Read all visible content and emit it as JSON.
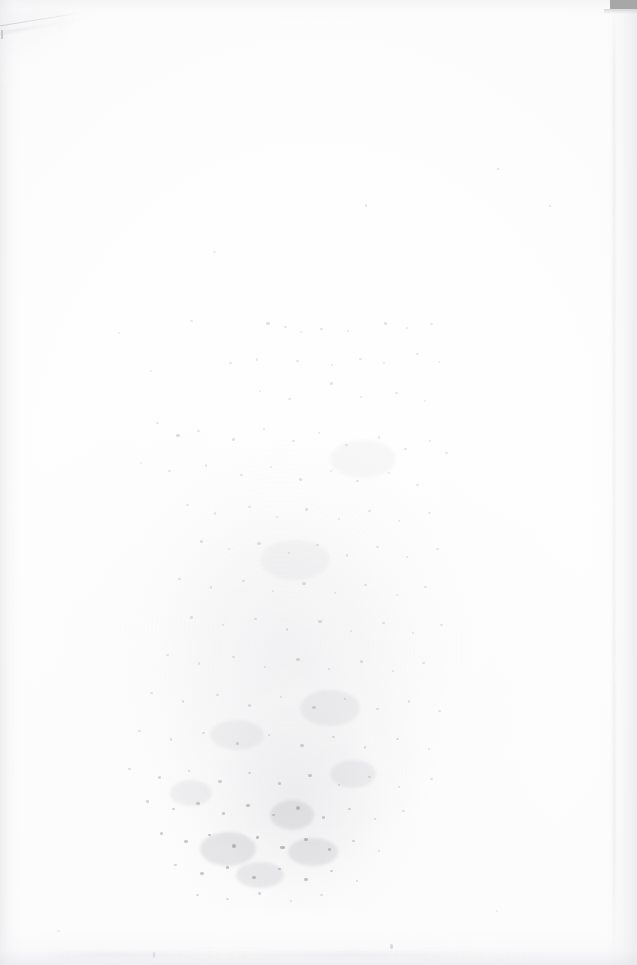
{
  "document": {
    "kind": "scanned-page",
    "description": "Blank verso of a scanned paper page",
    "page_width_px": 637,
    "page_height_px": 965,
    "visible_text": "",
    "text_legible": false,
    "orientation": "portrait"
  },
  "colors": {
    "paper_white": "#fdfdfd",
    "paper_tint": "#fbfbfc",
    "scanner_artifact_gray": "#a7a7a8",
    "edge_shadow_gray": "#e4e4e7",
    "crease_gray": "#c4c4c9",
    "speckle_ink_gray": "#8e8e96"
  },
  "artifacts": {
    "scanner_bed_patch": {
      "name": "scanner-bed-edge-artifact",
      "position": "top-right",
      "x": 610,
      "y": 0,
      "width": 27,
      "height": 9,
      "color": "#a7a7a8"
    },
    "corner_crease": {
      "name": "paper-fold-crease",
      "position": "top-left",
      "x": 0,
      "y": 6,
      "width": 96,
      "height": 34,
      "angle_deg": -9.4
    },
    "edge_shadows": [
      {
        "name": "left-edge-shadow",
        "side": "left",
        "width": 26
      },
      {
        "name": "right-edge-shadow",
        "side": "right",
        "width": 46
      },
      {
        "name": "top-edge-shadow",
        "side": "top",
        "height": 22
      },
      {
        "name": "bottom-edge-shadow",
        "side": "bottom",
        "height": 34
      }
    ],
    "bleed_through": {
      "name": "reverse-side-ink-bleed",
      "position": "lower-center",
      "bounds": {
        "x": 96,
        "y": 286,
        "width": 384,
        "height": 626
      },
      "densest_region": {
        "x": 170,
        "y": 775,
        "width": 200,
        "height": 110
      },
      "legible": false
    }
  },
  "speckles": [
    {
      "x": 497,
      "y": 168,
      "w": 2,
      "h": 2,
      "o": 0.3
    },
    {
      "x": 549,
      "y": 205,
      "w": 2,
      "h": 2,
      "o": 0.26
    },
    {
      "x": 365,
      "y": 204,
      "w": 2,
      "h": 3,
      "o": 0.22
    },
    {
      "x": 213,
      "y": 251,
      "w": 3,
      "h": 2,
      "o": 0.18
    },
    {
      "x": 190,
      "y": 320,
      "w": 3,
      "h": 2,
      "o": 0.2
    },
    {
      "x": 266,
      "y": 322,
      "w": 4,
      "h": 3,
      "o": 0.26
    },
    {
      "x": 284,
      "y": 326,
      "w": 3,
      "h": 2,
      "o": 0.22
    },
    {
      "x": 300,
      "y": 331,
      "w": 2,
      "h": 2,
      "o": 0.2
    },
    {
      "x": 320,
      "y": 328,
      "w": 3,
      "h": 2,
      "o": 0.24
    },
    {
      "x": 347,
      "y": 330,
      "w": 2,
      "h": 2,
      "o": 0.2
    },
    {
      "x": 384,
      "y": 322,
      "w": 3,
      "h": 3,
      "o": 0.26
    },
    {
      "x": 406,
      "y": 327,
      "w": 2,
      "h": 2,
      "o": 0.2
    },
    {
      "x": 430,
      "y": 323,
      "w": 3,
      "h": 2,
      "o": 0.22
    },
    {
      "x": 118,
      "y": 332,
      "w": 2,
      "h": 2,
      "o": 0.16
    },
    {
      "x": 229,
      "y": 362,
      "w": 3,
      "h": 2,
      "o": 0.22
    },
    {
      "x": 256,
      "y": 358,
      "w": 2,
      "h": 3,
      "o": 0.2
    },
    {
      "x": 296,
      "y": 360,
      "w": 3,
      "h": 2,
      "o": 0.24
    },
    {
      "x": 331,
      "y": 364,
      "w": 2,
      "h": 2,
      "o": 0.2
    },
    {
      "x": 359,
      "y": 358,
      "w": 3,
      "h": 2,
      "o": 0.22
    },
    {
      "x": 383,
      "y": 362,
      "w": 2,
      "h": 2,
      "o": 0.18
    },
    {
      "x": 416,
      "y": 353,
      "w": 3,
      "h": 2,
      "o": 0.22
    },
    {
      "x": 438,
      "y": 361,
      "w": 2,
      "h": 2,
      "o": 0.18
    },
    {
      "x": 150,
      "y": 370,
      "w": 2,
      "h": 2,
      "o": 0.16
    },
    {
      "x": 330,
      "y": 382,
      "w": 3,
      "h": 3,
      "o": 0.24
    },
    {
      "x": 259,
      "y": 390,
      "w": 2,
      "h": 2,
      "o": 0.18
    },
    {
      "x": 288,
      "y": 398,
      "w": 3,
      "h": 2,
      "o": 0.22
    },
    {
      "x": 360,
      "y": 396,
      "w": 2,
      "h": 2,
      "o": 0.2
    },
    {
      "x": 395,
      "y": 392,
      "w": 3,
      "h": 2,
      "o": 0.22
    },
    {
      "x": 424,
      "y": 400,
      "w": 2,
      "h": 2,
      "o": 0.18
    },
    {
      "x": 156,
      "y": 422,
      "w": 3,
      "h": 2,
      "o": 0.2
    },
    {
      "x": 176,
      "y": 434,
      "w": 4,
      "h": 3,
      "o": 0.3
    },
    {
      "x": 197,
      "y": 430,
      "w": 3,
      "h": 2,
      "o": 0.24
    },
    {
      "x": 232,
      "y": 438,
      "w": 3,
      "h": 3,
      "o": 0.26
    },
    {
      "x": 263,
      "y": 428,
      "w": 2,
      "h": 2,
      "o": 0.2
    },
    {
      "x": 292,
      "y": 440,
      "w": 3,
      "h": 2,
      "o": 0.24
    },
    {
      "x": 318,
      "y": 432,
      "w": 2,
      "h": 2,
      "o": 0.2
    },
    {
      "x": 345,
      "y": 444,
      "w": 3,
      "h": 2,
      "o": 0.24
    },
    {
      "x": 378,
      "y": 436,
      "w": 2,
      "h": 3,
      "o": 0.22
    },
    {
      "x": 404,
      "y": 448,
      "w": 3,
      "h": 2,
      "o": 0.24
    },
    {
      "x": 429,
      "y": 440,
      "w": 2,
      "h": 2,
      "o": 0.2
    },
    {
      "x": 445,
      "y": 452,
      "w": 3,
      "h": 2,
      "o": 0.22
    },
    {
      "x": 140,
      "y": 462,
      "w": 2,
      "h": 2,
      "o": 0.18
    },
    {
      "x": 168,
      "y": 470,
      "w": 3,
      "h": 2,
      "o": 0.22
    },
    {
      "x": 205,
      "y": 464,
      "w": 2,
      "h": 3,
      "o": 0.2
    },
    {
      "x": 240,
      "y": 474,
      "w": 3,
      "h": 2,
      "o": 0.24
    },
    {
      "x": 270,
      "y": 466,
      "w": 2,
      "h": 2,
      "o": 0.2
    },
    {
      "x": 299,
      "y": 478,
      "w": 3,
      "h": 3,
      "o": 0.26
    },
    {
      "x": 330,
      "y": 470,
      "w": 2,
      "h": 2,
      "o": 0.2
    },
    {
      "x": 356,
      "y": 480,
      "w": 3,
      "h": 2,
      "o": 0.24
    },
    {
      "x": 388,
      "y": 472,
      "w": 2,
      "h": 2,
      "o": 0.2
    },
    {
      "x": 416,
      "y": 484,
      "w": 3,
      "h": 2,
      "o": 0.22
    },
    {
      "x": 186,
      "y": 504,
      "w": 3,
      "h": 2,
      "o": 0.22
    },
    {
      "x": 214,
      "y": 512,
      "w": 2,
      "h": 3,
      "o": 0.22
    },
    {
      "x": 248,
      "y": 506,
      "w": 3,
      "h": 2,
      "o": 0.24
    },
    {
      "x": 276,
      "y": 516,
      "w": 2,
      "h": 2,
      "o": 0.2
    },
    {
      "x": 305,
      "y": 508,
      "w": 3,
      "h": 3,
      "o": 0.26
    },
    {
      "x": 338,
      "y": 518,
      "w": 2,
      "h": 2,
      "o": 0.22
    },
    {
      "x": 368,
      "y": 510,
      "w": 3,
      "h": 2,
      "o": 0.24
    },
    {
      "x": 398,
      "y": 520,
      "w": 2,
      "h": 2,
      "o": 0.2
    },
    {
      "x": 428,
      "y": 512,
      "w": 3,
      "h": 2,
      "o": 0.22
    },
    {
      "x": 200,
      "y": 540,
      "w": 3,
      "h": 3,
      "o": 0.26
    },
    {
      "x": 228,
      "y": 548,
      "w": 2,
      "h": 2,
      "o": 0.22
    },
    {
      "x": 257,
      "y": 542,
      "w": 4,
      "h": 3,
      "o": 0.28
    },
    {
      "x": 288,
      "y": 552,
      "w": 2,
      "h": 2,
      "o": 0.22
    },
    {
      "x": 316,
      "y": 544,
      "w": 3,
      "h": 2,
      "o": 0.24
    },
    {
      "x": 346,
      "y": 554,
      "w": 2,
      "h": 3,
      "o": 0.22
    },
    {
      "x": 376,
      "y": 546,
      "w": 3,
      "h": 2,
      "o": 0.24
    },
    {
      "x": 406,
      "y": 556,
      "w": 2,
      "h": 2,
      "o": 0.2
    },
    {
      "x": 436,
      "y": 548,
      "w": 3,
      "h": 2,
      "o": 0.22
    },
    {
      "x": 178,
      "y": 578,
      "w": 3,
      "h": 2,
      "o": 0.24
    },
    {
      "x": 210,
      "y": 586,
      "w": 2,
      "h": 3,
      "o": 0.22
    },
    {
      "x": 242,
      "y": 580,
      "w": 3,
      "h": 2,
      "o": 0.26
    },
    {
      "x": 272,
      "y": 590,
      "w": 2,
      "h": 2,
      "o": 0.22
    },
    {
      "x": 302,
      "y": 582,
      "w": 4,
      "h": 3,
      "o": 0.28
    },
    {
      "x": 334,
      "y": 592,
      "w": 2,
      "h": 2,
      "o": 0.22
    },
    {
      "x": 364,
      "y": 584,
      "w": 3,
      "h": 2,
      "o": 0.24
    },
    {
      "x": 396,
      "y": 594,
      "w": 2,
      "h": 2,
      "o": 0.2
    },
    {
      "x": 424,
      "y": 586,
      "w": 3,
      "h": 2,
      "o": 0.22
    },
    {
      "x": 190,
      "y": 616,
      "w": 3,
      "h": 3,
      "o": 0.26
    },
    {
      "x": 222,
      "y": 624,
      "w": 2,
      "h": 2,
      "o": 0.22
    },
    {
      "x": 254,
      "y": 618,
      "w": 3,
      "h": 2,
      "o": 0.26
    },
    {
      "x": 286,
      "y": 628,
      "w": 2,
      "h": 3,
      "o": 0.24
    },
    {
      "x": 318,
      "y": 620,
      "w": 4,
      "h": 3,
      "o": 0.3
    },
    {
      "x": 350,
      "y": 630,
      "w": 2,
      "h": 2,
      "o": 0.24
    },
    {
      "x": 382,
      "y": 622,
      "w": 3,
      "h": 2,
      "o": 0.26
    },
    {
      "x": 412,
      "y": 632,
      "w": 2,
      "h": 2,
      "o": 0.22
    },
    {
      "x": 440,
      "y": 624,
      "w": 3,
      "h": 2,
      "o": 0.22
    },
    {
      "x": 166,
      "y": 654,
      "w": 3,
      "h": 2,
      "o": 0.24
    },
    {
      "x": 198,
      "y": 662,
      "w": 2,
      "h": 3,
      "o": 0.24
    },
    {
      "x": 232,
      "y": 656,
      "w": 3,
      "h": 2,
      "o": 0.26
    },
    {
      "x": 264,
      "y": 666,
      "w": 2,
      "h": 2,
      "o": 0.24
    },
    {
      "x": 296,
      "y": 658,
      "w": 4,
      "h": 3,
      "o": 0.32
    },
    {
      "x": 328,
      "y": 668,
      "w": 2,
      "h": 2,
      "o": 0.26
    },
    {
      "x": 360,
      "y": 660,
      "w": 3,
      "h": 3,
      "o": 0.28
    },
    {
      "x": 392,
      "y": 670,
      "w": 2,
      "h": 2,
      "o": 0.24
    },
    {
      "x": 422,
      "y": 662,
      "w": 3,
      "h": 2,
      "o": 0.24
    },
    {
      "x": 150,
      "y": 692,
      "w": 3,
      "h": 2,
      "o": 0.24
    },
    {
      "x": 182,
      "y": 700,
      "w": 2,
      "h": 3,
      "o": 0.26
    },
    {
      "x": 216,
      "y": 694,
      "w": 3,
      "h": 2,
      "o": 0.28
    },
    {
      "x": 248,
      "y": 704,
      "w": 3,
      "h": 3,
      "o": 0.3
    },
    {
      "x": 280,
      "y": 696,
      "w": 2,
      "h": 2,
      "o": 0.26
    },
    {
      "x": 312,
      "y": 706,
      "w": 4,
      "h": 3,
      "o": 0.34
    },
    {
      "x": 344,
      "y": 698,
      "w": 2,
      "h": 2,
      "o": 0.28
    },
    {
      "x": 376,
      "y": 708,
      "w": 3,
      "h": 2,
      "o": 0.28
    },
    {
      "x": 408,
      "y": 700,
      "w": 2,
      "h": 3,
      "o": 0.26
    },
    {
      "x": 438,
      "y": 710,
      "w": 3,
      "h": 2,
      "o": 0.24
    },
    {
      "x": 138,
      "y": 730,
      "w": 3,
      "h": 2,
      "o": 0.26
    },
    {
      "x": 170,
      "y": 738,
      "w": 2,
      "h": 3,
      "o": 0.28
    },
    {
      "x": 202,
      "y": 732,
      "w": 3,
      "h": 2,
      "o": 0.3
    },
    {
      "x": 236,
      "y": 742,
      "w": 3,
      "h": 3,
      "o": 0.34
    },
    {
      "x": 268,
      "y": 734,
      "w": 2,
      "h": 2,
      "o": 0.3
    },
    {
      "x": 300,
      "y": 744,
      "w": 4,
      "h": 3,
      "o": 0.38
    },
    {
      "x": 332,
      "y": 736,
      "w": 3,
      "h": 2,
      "o": 0.32
    },
    {
      "x": 364,
      "y": 746,
      "w": 2,
      "h": 3,
      "o": 0.3
    },
    {
      "x": 396,
      "y": 738,
      "w": 3,
      "h": 2,
      "o": 0.28
    },
    {
      "x": 428,
      "y": 748,
      "w": 2,
      "h": 2,
      "o": 0.24
    },
    {
      "x": 128,
      "y": 768,
      "w": 3,
      "h": 2,
      "o": 0.28
    },
    {
      "x": 158,
      "y": 776,
      "w": 3,
      "h": 3,
      "o": 0.34
    },
    {
      "x": 188,
      "y": 770,
      "w": 2,
      "h": 2,
      "o": 0.32
    },
    {
      "x": 218,
      "y": 780,
      "w": 4,
      "h": 3,
      "o": 0.4
    },
    {
      "x": 248,
      "y": 772,
      "w": 3,
      "h": 2,
      "o": 0.36
    },
    {
      "x": 278,
      "y": 782,
      "w": 3,
      "h": 3,
      "o": 0.42
    },
    {
      "x": 308,
      "y": 774,
      "w": 4,
      "h": 3,
      "o": 0.44
    },
    {
      "x": 338,
      "y": 784,
      "w": 2,
      "h": 2,
      "o": 0.34
    },
    {
      "x": 368,
      "y": 776,
      "w": 3,
      "h": 2,
      "o": 0.3
    },
    {
      "x": 398,
      "y": 786,
      "w": 2,
      "h": 2,
      "o": 0.26
    },
    {
      "x": 430,
      "y": 778,
      "w": 3,
      "h": 2,
      "o": 0.24
    },
    {
      "x": 146,
      "y": 800,
      "w": 3,
      "h": 3,
      "o": 0.34
    },
    {
      "x": 172,
      "y": 808,
      "w": 3,
      "h": 2,
      "o": 0.38
    },
    {
      "x": 196,
      "y": 802,
      "w": 4,
      "h": 3,
      "o": 0.44
    },
    {
      "x": 222,
      "y": 812,
      "w": 3,
      "h": 3,
      "o": 0.46
    },
    {
      "x": 246,
      "y": 804,
      "w": 4,
      "h": 3,
      "o": 0.5
    },
    {
      "x": 272,
      "y": 814,
      "w": 3,
      "h": 2,
      "o": 0.48
    },
    {
      "x": 296,
      "y": 806,
      "w": 4,
      "h": 4,
      "o": 0.54
    },
    {
      "x": 322,
      "y": 816,
      "w": 3,
      "h": 3,
      "o": 0.46
    },
    {
      "x": 348,
      "y": 808,
      "w": 3,
      "h": 2,
      "o": 0.38
    },
    {
      "x": 374,
      "y": 818,
      "w": 2,
      "h": 2,
      "o": 0.3
    },
    {
      "x": 402,
      "y": 810,
      "w": 3,
      "h": 2,
      "o": 0.26
    },
    {
      "x": 160,
      "y": 832,
      "w": 3,
      "h": 3,
      "o": 0.4
    },
    {
      "x": 184,
      "y": 840,
      "w": 4,
      "h": 3,
      "o": 0.46
    },
    {
      "x": 208,
      "y": 834,
      "w": 3,
      "h": 2,
      "o": 0.5
    },
    {
      "x": 232,
      "y": 844,
      "w": 4,
      "h": 4,
      "o": 0.56
    },
    {
      "x": 256,
      "y": 836,
      "w": 3,
      "h": 3,
      "o": 0.54
    },
    {
      "x": 280,
      "y": 846,
      "w": 5,
      "h": 3,
      "o": 0.6
    },
    {
      "x": 304,
      "y": 838,
      "w": 4,
      "h": 3,
      "o": 0.58
    },
    {
      "x": 328,
      "y": 848,
      "w": 3,
      "h": 3,
      "o": 0.48
    },
    {
      "x": 352,
      "y": 840,
      "w": 3,
      "h": 2,
      "o": 0.38
    },
    {
      "x": 378,
      "y": 850,
      "w": 2,
      "h": 2,
      "o": 0.28
    },
    {
      "x": 174,
      "y": 864,
      "w": 3,
      "h": 2,
      "o": 0.38
    },
    {
      "x": 200,
      "y": 872,
      "w": 4,
      "h": 3,
      "o": 0.46
    },
    {
      "x": 226,
      "y": 866,
      "w": 3,
      "h": 3,
      "o": 0.5
    },
    {
      "x": 252,
      "y": 876,
      "w": 4,
      "h": 3,
      "o": 0.54
    },
    {
      "x": 278,
      "y": 868,
      "w": 3,
      "h": 2,
      "o": 0.5
    },
    {
      "x": 304,
      "y": 878,
      "w": 4,
      "h": 3,
      "o": 0.52
    },
    {
      "x": 330,
      "y": 870,
      "w": 3,
      "h": 2,
      "o": 0.42
    },
    {
      "x": 356,
      "y": 880,
      "w": 2,
      "h": 2,
      "o": 0.3
    },
    {
      "x": 196,
      "y": 894,
      "w": 3,
      "h": 2,
      "o": 0.3
    },
    {
      "x": 226,
      "y": 898,
      "w": 3,
      "h": 2,
      "o": 0.32
    },
    {
      "x": 258,
      "y": 892,
      "w": 3,
      "h": 3,
      "o": 0.34
    },
    {
      "x": 290,
      "y": 900,
      "w": 2,
      "h": 2,
      "o": 0.28
    },
    {
      "x": 320,
      "y": 894,
      "w": 3,
      "h": 2,
      "o": 0.26
    },
    {
      "x": 390,
      "y": 944,
      "w": 3,
      "h": 5,
      "o": 0.3
    },
    {
      "x": 153,
      "y": 952,
      "w": 2,
      "h": 6,
      "o": 0.22
    },
    {
      "x": 57,
      "y": 930,
      "w": 3,
      "h": 2,
      "o": 0.14
    },
    {
      "x": 496,
      "y": 910,
      "w": 2,
      "h": 2,
      "o": 0.16
    }
  ],
  "blots": [
    {
      "x": 270,
      "y": 800,
      "w": 44,
      "h": 30,
      "o": 0.16
    },
    {
      "x": 200,
      "y": 832,
      "w": 56,
      "h": 34,
      "o": 0.18
    },
    {
      "x": 288,
      "y": 838,
      "w": 50,
      "h": 28,
      "o": 0.17
    },
    {
      "x": 236,
      "y": 862,
      "w": 48,
      "h": 26,
      "o": 0.15
    },
    {
      "x": 300,
      "y": 690,
      "w": 60,
      "h": 36,
      "o": 0.1
    },
    {
      "x": 210,
      "y": 720,
      "w": 54,
      "h": 30,
      "o": 0.09
    },
    {
      "x": 330,
      "y": 760,
      "w": 46,
      "h": 28,
      "o": 0.11
    },
    {
      "x": 170,
      "y": 780,
      "w": 42,
      "h": 26,
      "o": 0.1
    },
    {
      "x": 260,
      "y": 540,
      "w": 70,
      "h": 40,
      "o": 0.06
    },
    {
      "x": 330,
      "y": 440,
      "w": 66,
      "h": 38,
      "o": 0.05
    }
  ]
}
